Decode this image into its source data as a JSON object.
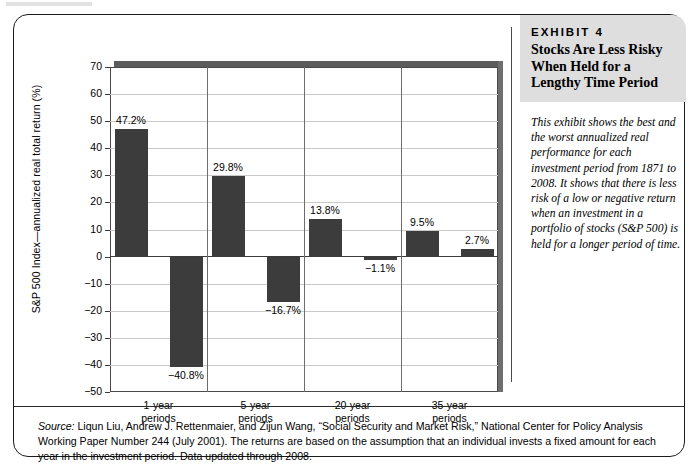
{
  "exhibit": {
    "number_label": "EXHIBIT 4",
    "title": "Stocks Are Less Risky When Held for a Lengthy Time Period",
    "description": "This exhibit shows the best and the worst annualized real performance for each investment period from 1871 to 2008. It shows that there is less risk of a low or negative return when an investment in a portfolio of stocks (S&P 500) is held for a longer period of time."
  },
  "source": {
    "lead_word": "Source:",
    "text": " Liqun Liu, Andrew J. Rettenmaier, and Zijun Wang, “Social Security and Market Risk,” National Center for Policy Analysis Working Paper Number 244 (July 2001). The returns are based on the assumption that an individual invests a fixed amount for each year in the investment period. Data updated through 2008."
  },
  "chart_data": {
    "type": "bar",
    "title": "Stocks Are Less Risky When Held for a Lengthy Time Period",
    "xlabel": "",
    "ylabel": "S&P 500 Index—annualized real total return (%)",
    "ylim": [
      -50,
      70
    ],
    "ytick_values": [
      70,
      60,
      50,
      40,
      30,
      20,
      10,
      0,
      -10,
      -20,
      -30,
      -40,
      -50
    ],
    "ytick_labels": [
      "70",
      "60",
      "50",
      "40",
      "30",
      "20",
      "10",
      "0",
      "−10",
      "−20",
      "−30",
      "−40",
      "−50"
    ],
    "grid": true,
    "legend": "none",
    "categories": [
      "1-year periods",
      "5-year periods",
      "20-year periods",
      "35-year periods"
    ],
    "series": [
      {
        "name": "Best annualized real total return",
        "values": [
          47.2,
          29.8,
          13.8,
          9.5
        ]
      },
      {
        "name": "Worst annualized real total return",
        "values": [
          -40.8,
          -16.7,
          -1.1,
          2.7
        ]
      }
    ],
    "bar_labels": [
      [
        "47.2%",
        "29.8%",
        "13.8%",
        "9.5%"
      ],
      [
        "−40.8%",
        "−16.7%",
        "−1.1%",
        "2.7%"
      ]
    ],
    "bar_color": "#3c3c3c",
    "axis_color": "#3a3a3a",
    "grid_color": "#c9c9c9",
    "category_lines": [
      "1-year",
      "5-year",
      "20-year",
      "35-year"
    ],
    "category_line2": "periods"
  }
}
